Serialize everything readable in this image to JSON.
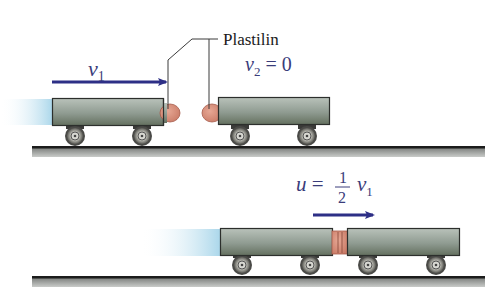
{
  "diagram": {
    "type": "physics-inelastic-collision",
    "colors": {
      "arrow": "#2d2f86",
      "math_text": "#3a3c7a",
      "label_text": "#1a1a1a",
      "clay": "#d9917d",
      "clay_edge": "#a65a4a",
      "cart_top": "#b4bdb5",
      "cart_bottom": "#687469",
      "cart_edge": "#2c2f2c",
      "track_line": "#1c1c1c",
      "track_fill": "#9a9d9a",
      "blur": "#bfe0ee"
    },
    "top_scene": {
      "clay_label": "Plastilin",
      "velocity1_symbol": "v",
      "velocity1_sub": "1",
      "velocity2_symbol": "v",
      "velocity2_sub": "2",
      "velocity2_eq": " = 0"
    },
    "bottom_scene": {
      "final_symbol": "u",
      "final_eq": " = ",
      "frac_num": "1",
      "frac_den": "2",
      "final_v_symbol": "v",
      "final_v_sub": "1"
    }
  }
}
